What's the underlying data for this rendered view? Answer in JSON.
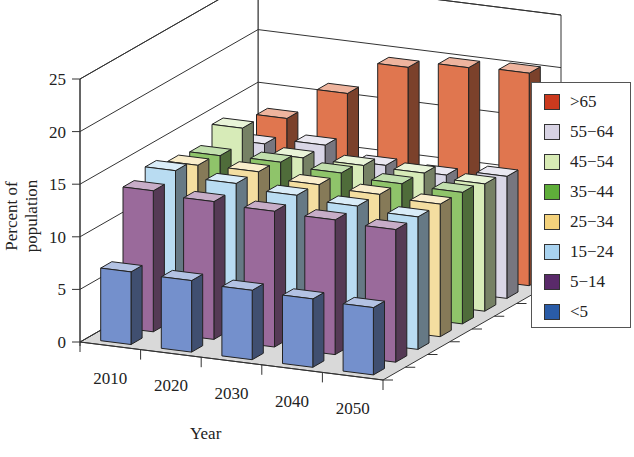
{
  "chart_data": {
    "type": "bar",
    "subtype": "3d-grouped",
    "title": "",
    "xlabel": "Year",
    "ylabel": "Percent of population",
    "ylim": [
      0,
      25
    ],
    "yticks": [
      0,
      5,
      10,
      15,
      20,
      25
    ],
    "categories": [
      "2010",
      "2020",
      "2030",
      "2040",
      "2050"
    ],
    "grid": true,
    "legend_position": "right",
    "series": [
      {
        "name": ">65",
        "color": "#e0764f",
        "values": [
          13.0,
          16.1,
          19.3,
          20.0,
          20.2
        ]
      },
      {
        "name": "55−64",
        "color": "#d9d6e6",
        "values": [
          11.8,
          12.4,
          11.2,
          11.0,
          11.6
        ]
      },
      {
        "name": "45−54",
        "color": "#d7ebb8",
        "values": [
          14.5,
          12.4,
          12.4,
          12.4,
          12.1
        ]
      },
      {
        "name": "35−44",
        "color": "#8fc46a",
        "values": [
          13.1,
          13.2,
          12.9,
          12.6,
          12.5
        ]
      },
      {
        "name": "25−34",
        "color": "#f4dea0",
        "values": [
          13.4,
          13.5,
          13.0,
          12.8,
          12.6
        ]
      },
      {
        "name": "15−24",
        "color": "#b9dcf2",
        "values": [
          14.1,
          13.6,
          13.2,
          12.9,
          12.6
        ]
      },
      {
        "name": "5−14",
        "color": "#9a6a9b",
        "values": [
          13.4,
          13.1,
          12.9,
          12.8,
          12.6
        ]
      },
      {
        "name": "<5",
        "color": "#7490cc",
        "values": [
          6.9,
          6.8,
          6.6,
          6.5,
          6.4
        ]
      }
    ]
  },
  "legend": {
    "items": [
      {
        "label": ">65",
        "color": "#cc3a1e"
      },
      {
        "label": "55−64",
        "color": "#d8d3e4"
      },
      {
        "label": "45−54",
        "color": "#d8ebb5"
      },
      {
        "label": "35−44",
        "color": "#5fae3a"
      },
      {
        "label": "25−34",
        "color": "#f4d27c"
      },
      {
        "label": "15−24",
        "color": "#a9d3f0"
      },
      {
        "label": "5−14",
        "color": "#5a2a6a"
      },
      {
        "label": "<5",
        "color": "#2a5ca8"
      }
    ]
  },
  "axis": {
    "ylabel": "Percent of population",
    "xlabel": "Year"
  }
}
